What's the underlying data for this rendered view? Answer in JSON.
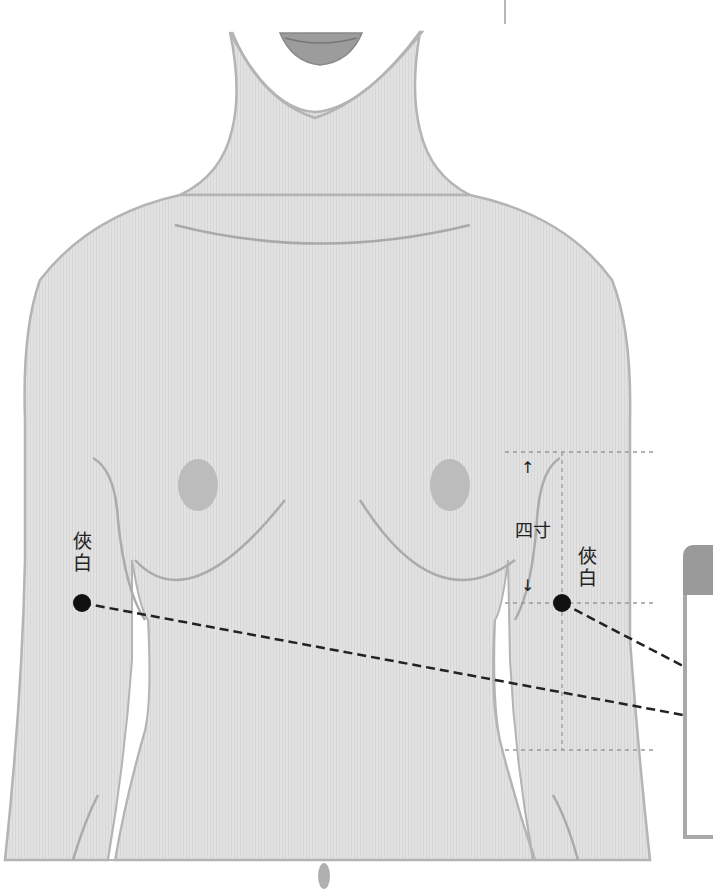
{
  "figure": {
    "colors": {
      "skin": "#dedede",
      "outline": "#b4b4b4",
      "detail": "#aaaaaa",
      "nipple": "#bdbdbd",
      "lips": "#8f8f8f",
      "point": "#111111",
      "guide": "#9a9a9a",
      "leader": "#222222"
    }
  },
  "annotations": {
    "left_point": {
      "label": "俠白",
      "char1": "俠",
      "char2": "白"
    },
    "right_point": {
      "label": "俠白",
      "char1": "俠",
      "char2": "白"
    },
    "measurement": {
      "label": "四寸",
      "up_arrow": "↑",
      "down_arrow": "↓"
    }
  },
  "panel": {
    "visible": "partial",
    "text": ""
  }
}
